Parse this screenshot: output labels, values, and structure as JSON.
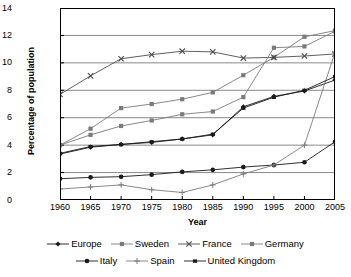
{
  "chart_data": {
    "type": "line",
    "title": "",
    "xlabel": "Year",
    "ylabel": "Percentage of population",
    "x": [
      1960,
      1965,
      1970,
      1975,
      1980,
      1985,
      1990,
      1995,
      2000,
      2005
    ],
    "xtick_labels": [
      "1960",
      "1965",
      "1970",
      "1975",
      "1980",
      "1985",
      "1990",
      "1995",
      "2000",
      "2005"
    ],
    "ytick_labels": [
      "0",
      "2",
      "4",
      "6",
      "8",
      "10",
      "12",
      "14"
    ],
    "xlim": [
      1960,
      2005
    ],
    "ylim": [
      0,
      14
    ],
    "ystep": 2,
    "grid": "horizontal",
    "legend_position": "bottom",
    "series": [
      {
        "name": "Europe",
        "marker": "diamond",
        "values": [
          3.35,
          3.85,
          4.05,
          4.2,
          4.45,
          4.75,
          6.8,
          7.55,
          7.95,
          8.75
        ]
      },
      {
        "name": "Sweden",
        "marker": "square",
        "values": [
          4.0,
          5.2,
          6.7,
          7.0,
          7.35,
          7.85,
          9.1,
          10.4,
          11.9,
          12.35
        ]
      },
      {
        "name": "France",
        "marker": "cross",
        "values": [
          7.7,
          9.05,
          10.3,
          10.6,
          10.85,
          10.8,
          10.35,
          10.4,
          10.5,
          10.65
        ]
      },
      {
        "name": "Germany",
        "marker": "square",
        "values": [
          4.0,
          4.75,
          5.4,
          5.8,
          6.25,
          6.45,
          7.5,
          11.1,
          11.2,
          12.3
        ]
      },
      {
        "name": "Italy",
        "marker": "circle",
        "values": [
          1.55,
          1.65,
          1.7,
          1.85,
          2.05,
          2.2,
          2.4,
          2.55,
          2.75,
          4.25
        ]
      },
      {
        "name": "Spain",
        "marker": "plus",
        "values": [
          0.8,
          0.95,
          1.1,
          0.75,
          0.55,
          1.1,
          1.9,
          2.55,
          4.0,
          10.75
        ]
      },
      {
        "name": "United Kingdom",
        "marker": "dash",
        "values": [
          3.4,
          3.9,
          4.05,
          4.25,
          4.45,
          4.8,
          6.7,
          7.5,
          8.0,
          9.0
        ]
      }
    ]
  },
  "legend": {
    "rows": [
      [
        {
          "label": "Europe",
          "marker": "diamond"
        },
        {
          "label": "Sweden",
          "marker": "square"
        },
        {
          "label": "France",
          "marker": "cross"
        },
        {
          "label": "Germany",
          "marker": "square"
        }
      ],
      [
        {
          "label": "Italy",
          "marker": "circle"
        },
        {
          "label": "Spain",
          "marker": "plus"
        },
        {
          "label": "United Kingdom",
          "marker": "dash"
        }
      ]
    ]
  },
  "colors": {
    "axis": "#000000",
    "grid": "#8a8a8a",
    "series_dark": "#1a1a1a",
    "series_mid": "#4d4d4d",
    "series_light": "#7a7a7a",
    "background": "#ffffff"
  }
}
